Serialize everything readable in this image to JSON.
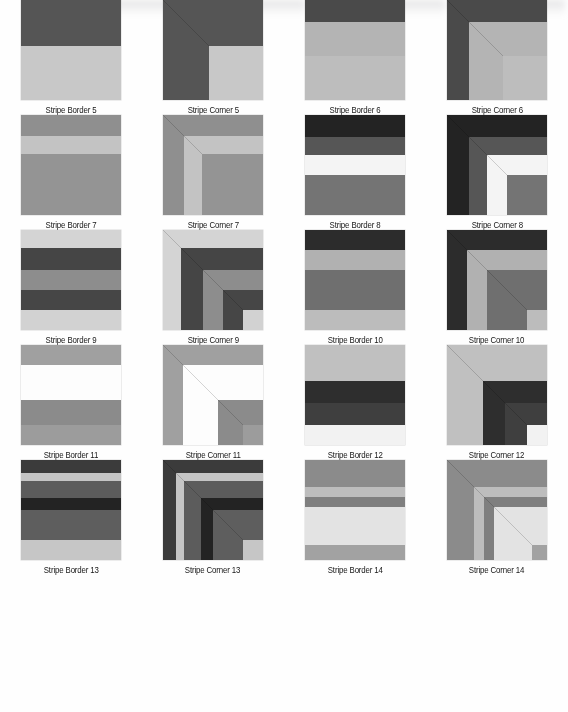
{
  "page": {
    "columns": 4,
    "rows": 5,
    "swatch_size_px": 100
  },
  "artifacts": [
    {
      "name": "scan-smudge-1",
      "left": 55,
      "width": 120
    },
    {
      "name": "scan-smudge-2",
      "left": 195,
      "width": 110
    },
    {
      "name": "scan-smudge-3",
      "left": 330,
      "width": 115
    },
    {
      "name": "scan-smudge-4",
      "left": 450,
      "width": 115
    }
  ],
  "swatches": [
    {
      "label": "Stripe Border 5",
      "kind": "border",
      "stripes": [
        {
          "color": "#555555",
          "span": 46
        },
        {
          "color": "#c8c8c8",
          "span": 54
        }
      ]
    },
    {
      "label": "Stripe Corner 5",
      "kind": "corner",
      "stripes": [
        {
          "color": "#555555",
          "span": 46
        },
        {
          "color": "#c8c8c8",
          "span": 54
        }
      ]
    },
    {
      "label": "Stripe Border 6",
      "kind": "border",
      "stripes": [
        {
          "color": "#4a4a4a",
          "span": 22
        },
        {
          "color": "#b4b4b4",
          "span": 34
        },
        {
          "color": "#bdbdbd",
          "span": 44
        }
      ]
    },
    {
      "label": "Stripe Corner 6",
      "kind": "corner",
      "stripes": [
        {
          "color": "#4a4a4a",
          "span": 22
        },
        {
          "color": "#b4b4b4",
          "span": 34
        },
        {
          "color": "#bdbdbd",
          "span": 44
        }
      ]
    },
    {
      "label": "Stripe Border 7",
      "kind": "border",
      "stripes": [
        {
          "color": "#8f8f8f",
          "span": 21
        },
        {
          "color": "#c3c3c3",
          "span": 18
        },
        {
          "color": "#949494",
          "span": 61
        }
      ]
    },
    {
      "label": "Stripe Corner 7",
      "kind": "corner",
      "stripes": [
        {
          "color": "#8f8f8f",
          "span": 21
        },
        {
          "color": "#c3c3c3",
          "span": 18
        },
        {
          "color": "#949494",
          "span": 61
        }
      ]
    },
    {
      "label": "Stripe Border 8",
      "kind": "border",
      "stripes": [
        {
          "color": "#232323",
          "span": 22
        },
        {
          "color": "#565656",
          "span": 18
        },
        {
          "color": "#f4f4f4",
          "span": 20
        },
        {
          "color": "#747474",
          "span": 40
        }
      ]
    },
    {
      "label": "Stripe Corner 8",
      "kind": "corner",
      "stripes": [
        {
          "color": "#232323",
          "span": 22
        },
        {
          "color": "#565656",
          "span": 18
        },
        {
          "color": "#f4f4f4",
          "span": 20
        },
        {
          "color": "#747474",
          "span": 40
        }
      ]
    },
    {
      "label": "Stripe Border 9",
      "kind": "border",
      "stripes": [
        {
          "color": "#d4d4d4",
          "span": 18
        },
        {
          "color": "#454545",
          "span": 22
        },
        {
          "color": "#8d8d8d",
          "span": 20
        },
        {
          "color": "#464646",
          "span": 20
        },
        {
          "color": "#d2d2d2",
          "span": 20
        }
      ]
    },
    {
      "label": "Stripe Corner 9",
      "kind": "corner",
      "stripes": [
        {
          "color": "#d4d4d4",
          "span": 18
        },
        {
          "color": "#454545",
          "span": 22
        },
        {
          "color": "#8d8d8d",
          "span": 20
        },
        {
          "color": "#464646",
          "span": 20
        },
        {
          "color": "#d2d2d2",
          "span": 20
        }
      ]
    },
    {
      "label": "Stripe Border 10",
      "kind": "border",
      "stripes": [
        {
          "color": "#2c2c2c",
          "span": 20
        },
        {
          "color": "#b1b1b1",
          "span": 20
        },
        {
          "color": "#6f6f6f",
          "span": 40
        },
        {
          "color": "#bcbcbc",
          "span": 20
        }
      ]
    },
    {
      "label": "Stripe Corner 10",
      "kind": "corner",
      "stripes": [
        {
          "color": "#2c2c2c",
          "span": 20
        },
        {
          "color": "#b1b1b1",
          "span": 20
        },
        {
          "color": "#6f6f6f",
          "span": 40
        },
        {
          "color": "#bcbcbc",
          "span": 20
        }
      ]
    },
    {
      "label": "Stripe Border 11",
      "kind": "border",
      "stripes": [
        {
          "color": "#a0a0a0",
          "span": 20
        },
        {
          "color": "#fdfdfd",
          "span": 35
        },
        {
          "color": "#8b8b8b",
          "span": 25
        },
        {
          "color": "#9c9c9c",
          "span": 20
        }
      ]
    },
    {
      "label": "Stripe Corner 11",
      "kind": "corner",
      "stripes": [
        {
          "color": "#a0a0a0",
          "span": 20
        },
        {
          "color": "#fdfdfd",
          "span": 35
        },
        {
          "color": "#8b8b8b",
          "span": 25
        },
        {
          "color": "#9c9c9c",
          "span": 20
        }
      ]
    },
    {
      "label": "Stripe Border 12",
      "kind": "border",
      "stripes": [
        {
          "color": "#c0c0c0",
          "span": 36
        },
        {
          "color": "#2e2e2e",
          "span": 22
        },
        {
          "color": "#3f3f3f",
          "span": 22
        },
        {
          "color": "#f2f2f2",
          "span": 20
        }
      ]
    },
    {
      "label": "Stripe Corner 12",
      "kind": "corner",
      "stripes": [
        {
          "color": "#c0c0c0",
          "span": 36
        },
        {
          "color": "#2e2e2e",
          "span": 22
        },
        {
          "color": "#3f3f3f",
          "span": 22
        },
        {
          "color": "#f2f2f2",
          "span": 20
        }
      ]
    },
    {
      "label": "Stripe Border 13",
      "kind": "border",
      "stripes": [
        {
          "color": "#3b3b3b",
          "span": 13
        },
        {
          "color": "#c5c5c5",
          "span": 8
        },
        {
          "color": "#5c5c5c",
          "span": 17
        },
        {
          "color": "#232323",
          "span": 12
        },
        {
          "color": "#5e5e5e",
          "span": 30
        },
        {
          "color": "#c6c6c6",
          "span": 20
        }
      ]
    },
    {
      "label": "Stripe Corner 13",
      "kind": "corner",
      "stripes": [
        {
          "color": "#3b3b3b",
          "span": 13
        },
        {
          "color": "#c5c5c5",
          "span": 8
        },
        {
          "color": "#5c5c5c",
          "span": 17
        },
        {
          "color": "#232323",
          "span": 12
        },
        {
          "color": "#5e5e5e",
          "span": 30
        },
        {
          "color": "#c6c6c6",
          "span": 20
        }
      ]
    },
    {
      "label": "Stripe Border 14",
      "kind": "border",
      "stripes": [
        {
          "color": "#8b8b8b",
          "span": 27
        },
        {
          "color": "#bdbdbd",
          "span": 10
        },
        {
          "color": "#7f7f7f",
          "span": 10
        },
        {
          "color": "#e3e3e3",
          "span": 38
        },
        {
          "color": "#a2a2a2",
          "span": 15
        }
      ]
    },
    {
      "label": "Stripe Corner 14",
      "kind": "corner",
      "stripes": [
        {
          "color": "#8b8b8b",
          "span": 27
        },
        {
          "color": "#bdbdbd",
          "span": 10
        },
        {
          "color": "#7f7f7f",
          "span": 10
        },
        {
          "color": "#e3e3e3",
          "span": 38
        },
        {
          "color": "#a2a2a2",
          "span": 15
        }
      ]
    }
  ]
}
